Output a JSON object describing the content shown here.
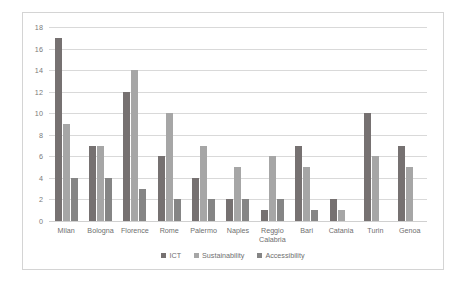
{
  "chart_data": {
    "type": "bar",
    "title": "",
    "subtitle": "",
    "xlabel": "",
    "ylabel": "",
    "ylim": [
      0,
      18
    ],
    "ytick_step": 2,
    "yticks": [
      0,
      2,
      4,
      6,
      8,
      10,
      12,
      14,
      16,
      18
    ],
    "grid": "horizontal",
    "legend_position": "bottom-center",
    "categories": [
      "Milan",
      "Bologna",
      "Florence",
      "Rome",
      "Palermo",
      "Naples",
      "Reggio\nCalabria",
      "Bari",
      "Catania",
      "Turin",
      "Genoa"
    ],
    "series": [
      {
        "name": "ICT",
        "color": "#767171",
        "values": [
          17,
          7,
          12,
          6,
          4,
          2,
          1,
          7,
          2,
          10,
          7
        ]
      },
      {
        "name": "Sustainability",
        "color": "#a6a6a6",
        "values": [
          9,
          7,
          14,
          10,
          7,
          5,
          6,
          5,
          1,
          6,
          5
        ]
      },
      {
        "name": "Accessibility",
        "color": "#858585",
        "values": [
          4,
          4,
          3,
          2,
          2,
          2,
          2,
          1,
          0,
          0,
          0
        ]
      }
    ]
  },
  "colors": {
    "series_ict": "#767171",
    "series_sustainability": "#a6a6a6",
    "series_accessibility": "#858585",
    "gridline": "#d9d9d9",
    "border": "#d4d4d4",
    "text": "#6f6f6f",
    "background": "#ffffff"
  }
}
